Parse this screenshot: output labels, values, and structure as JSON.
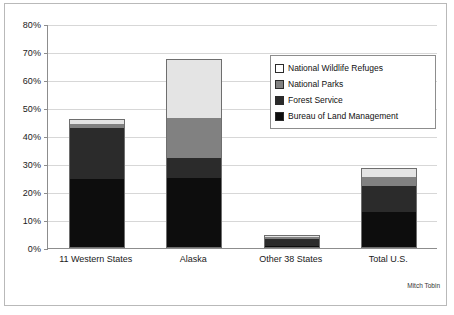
{
  "credit": "Mitch Tobin",
  "legend": {
    "items": [
      {
        "label": "National Wildlife Refuges",
        "swatch": "nwr",
        "color": "#ffffff"
      },
      {
        "label": "National Parks",
        "swatch": "np",
        "color": "#818181"
      },
      {
        "label": "Forest Service",
        "swatch": "fs",
        "color": "#2b2b2b"
      },
      {
        "label": "Bureau of Land Management",
        "swatch": "blm",
        "color": "#0d0d0d"
      }
    ]
  },
  "chart_data": {
    "type": "bar",
    "stacked": true,
    "title": "",
    "xlabel": "",
    "ylabel": "",
    "ylim": [
      0,
      80
    ],
    "ytick_labels": [
      "0%",
      "10%",
      "20%",
      "30%",
      "40%",
      "50%",
      "60%",
      "70%",
      "80%"
    ],
    "ytick_values": [
      0,
      10,
      20,
      30,
      40,
      50,
      60,
      70,
      80
    ],
    "grid": true,
    "legend_position": "upper right",
    "categories": [
      "11 Western States",
      "Alaska",
      "Other 38 States",
      "Total U.S."
    ],
    "series": [
      {
        "name": "Bureau of Land Management",
        "color": "#0d0d0d",
        "values": [
          24.5,
          25.0,
          0.6,
          13.0
        ]
      },
      {
        "name": "Forest Service",
        "color": "#2b2b2b",
        "values": [
          18.5,
          7.0,
          3.0,
          9.5
        ]
      },
      {
        "name": "National Parks",
        "color": "#818181",
        "values": [
          1.8,
          14.5,
          0.5,
          3.0
        ]
      },
      {
        "name": "National Wildlife Refuges",
        "color": "#e4e4e4",
        "values": [
          1.2,
          21.0,
          0.4,
          3.0
        ]
      }
    ],
    "totals": [
      46.0,
      67.5,
      4.5,
      28.5
    ]
  }
}
